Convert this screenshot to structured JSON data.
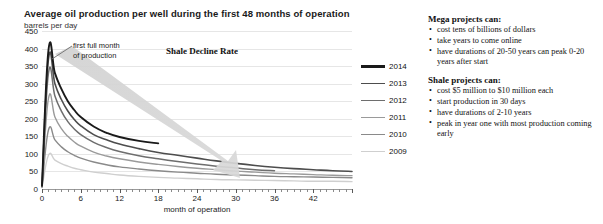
{
  "chart_data": {
    "type": "line",
    "title": "Average oil production per well during the first 48 months of operation",
    "subtitle": "barrels per day",
    "xlabel": "month of operation",
    "ylabel": "barrels per day",
    "xlim": [
      0,
      48
    ],
    "ylim": [
      0,
      450
    ],
    "ytick_labels": [
      "450",
      "400",
      "350",
      "300",
      "250",
      "200",
      "150",
      "100",
      "50",
      "0"
    ],
    "ytick_values": [
      450,
      400,
      350,
      300,
      250,
      200,
      150,
      100,
      50,
      0
    ],
    "xtick_labels": [
      "0",
      "6",
      "12",
      "18",
      "24",
      "30",
      "36",
      "42"
    ],
    "xtick_values": [
      0,
      6,
      12,
      18,
      24,
      30,
      36,
      42
    ],
    "grid": "horizontal",
    "legend_position": "right",
    "x": [
      0,
      1,
      2,
      3,
      4,
      5,
      6,
      8,
      10,
      12,
      15,
      18,
      21,
      24,
      27,
      30,
      33,
      36,
      39,
      42,
      45,
      48
    ],
    "series": [
      {
        "name": "2014",
        "color": "#1a1a1a",
        "values": [
          10,
          395,
          330,
          285,
          250,
          225,
          205,
          178,
          160,
          148,
          137,
          130,
          null,
          null,
          null,
          null,
          null,
          null,
          null,
          null,
          null,
          null
        ]
      },
      {
        "name": "2013",
        "color": "#4d4d4d",
        "values": [
          8,
          370,
          300,
          255,
          222,
          198,
          180,
          155,
          140,
          128,
          115,
          104,
          96,
          88,
          80,
          73,
          67,
          62,
          58,
          55,
          52,
          50
        ]
      },
      {
        "name": "2012",
        "color": "#6e6e6e",
        "values": [
          8,
          330,
          265,
          222,
          192,
          171,
          155,
          133,
          118,
          107,
          95,
          86,
          78,
          71,
          65,
          60,
          55,
          52,
          null,
          null,
          null,
          null
        ]
      },
      {
        "name": "2011",
        "color": "#9a9a9a",
        "values": [
          6,
          258,
          205,
          172,
          150,
          134,
          122,
          105,
          94,
          86,
          77,
          70,
          64,
          59,
          55,
          51,
          48,
          45,
          43,
          41,
          39,
          38
        ]
      },
      {
        "name": "2010",
        "color": "#8a8a8a",
        "values": [
          5,
          168,
          140,
          120,
          106,
          96,
          88,
          77,
          69,
          63,
          57,
          52,
          48,
          45,
          42,
          40,
          38,
          36,
          35,
          34,
          33,
          32
        ]
      },
      {
        "name": "2009",
        "color": "#cfcfcf",
        "values": [
          4,
          96,
          82,
          72,
          65,
          59,
          55,
          48,
          44,
          40,
          36,
          33,
          31,
          29,
          27,
          26,
          25,
          24,
          23,
          22,
          22,
          21
        ]
      }
    ],
    "annotations": [
      {
        "name": "first-full-month",
        "line1": "first full month",
        "line2": "of production"
      },
      {
        "name": "shale-decline-rate",
        "text": "Shale Decline Rate"
      }
    ]
  },
  "legend": {
    "items": [
      {
        "label": "2014",
        "color": "#1a1a1a"
      },
      {
        "label": "2013",
        "color": "#4d4d4d"
      },
      {
        "label": "2012",
        "color": "#6e6e6e"
      },
      {
        "label": "2011",
        "color": "#9a9a9a"
      },
      {
        "label": "2010",
        "color": "#8a8a8a"
      },
      {
        "label": "2009",
        "color": "#cfcfcf"
      }
    ]
  },
  "notes": {
    "mega": {
      "heading": "Mega projects can:",
      "bullets": [
        "cost tens of billions of dollars",
        "take years to come online",
        "have durations of 20-50 years can peak 0-20 years after start"
      ]
    },
    "shale": {
      "heading": "Shale projects can:",
      "bullets": [
        "cost $5 million to $10 million each",
        "start production in 30 days",
        "have durations of 2-10 years",
        "peak in year one with most production coming early"
      ]
    }
  }
}
